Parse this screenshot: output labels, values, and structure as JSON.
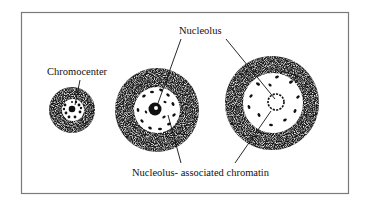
{
  "figure": {
    "labels": {
      "chromocenter": "Chromocenter",
      "nucleolus": "Nucleolus",
      "nucleolus_associated_chromatin": "Nucleolus- associated chromatin"
    },
    "cells": [
      {
        "name": "small-nucleus",
        "has": "chromocenter"
      },
      {
        "name": "medium-nucleus",
        "has": "nucleolus"
      },
      {
        "name": "large-nucleus",
        "has": "nucleolus"
      }
    ],
    "colors": {
      "frame": "#7a7a7a",
      "chromatin": "#1a1a1a",
      "background": "#ffffff"
    }
  }
}
